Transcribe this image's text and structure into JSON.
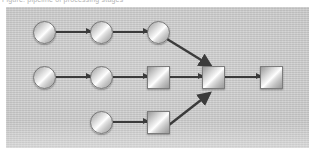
{
  "caption": {
    "text": "Figure: pipeline of processing stages"
  },
  "panel": {
    "background_color": "#c8c8c8",
    "border_color": "#bdbdbd"
  },
  "diagram": {
    "type": "flow-graph",
    "edge_color": "#3b3b3b",
    "node_fill_light": "#ffffff",
    "node_fill_dark": "#9a9a9a",
    "node_border_color": "#7c7c7c",
    "rows": [
      {
        "name": "top-row",
        "nodes": [
          {
            "id": "t1",
            "shape": "circle",
            "x": 44,
            "y": 32
          },
          {
            "id": "t2",
            "shape": "circle",
            "x": 101,
            "y": 32
          },
          {
            "id": "t3",
            "shape": "circle",
            "x": 158,
            "y": 32
          }
        ]
      },
      {
        "name": "middle-row",
        "nodes": [
          {
            "id": "m1",
            "shape": "circle",
            "x": 44,
            "y": 77
          },
          {
            "id": "m2",
            "shape": "circle",
            "x": 101,
            "y": 77
          },
          {
            "id": "m3",
            "shape": "square",
            "x": 158,
            "y": 77
          },
          {
            "id": "m4",
            "shape": "square",
            "x": 213,
            "y": 77
          },
          {
            "id": "m5",
            "shape": "square",
            "x": 271,
            "y": 77
          }
        ]
      },
      {
        "name": "bottom-row",
        "nodes": [
          {
            "id": "b1",
            "shape": "circle",
            "x": 101,
            "y": 122
          },
          {
            "id": "b2",
            "shape": "square",
            "x": 158,
            "y": 122
          }
        ]
      }
    ],
    "edges": [
      {
        "from": "t1",
        "to": "t2",
        "kind": "horizontal"
      },
      {
        "from": "t2",
        "to": "t3",
        "kind": "horizontal"
      },
      {
        "from": "t3",
        "to": "m4",
        "kind": "diagonal-down"
      },
      {
        "from": "m1",
        "to": "m2",
        "kind": "horizontal"
      },
      {
        "from": "m2",
        "to": "m3",
        "kind": "horizontal"
      },
      {
        "from": "m3",
        "to": "m4",
        "kind": "horizontal"
      },
      {
        "from": "m4",
        "to": "m5",
        "kind": "horizontal"
      },
      {
        "from": "b1",
        "to": "b2",
        "kind": "horizontal"
      },
      {
        "from": "b2",
        "to": "m4",
        "kind": "diagonal-up"
      }
    ]
  }
}
